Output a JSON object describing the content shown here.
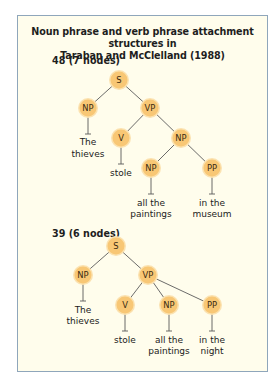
{
  "figure": {
    "title_line1": "Noun phrase and verb phrase attachment structures in",
    "title_line2": "Taraban and McClelland (1988)",
    "colors": {
      "background": "#fffdec",
      "border": "#8fa6bb",
      "node_fill": "#f8c775",
      "edge": "#5a5a5a"
    }
  },
  "trees": [
    {
      "label": "48 (7 nodes)",
      "nodes": [
        {
          "id": "s",
          "label": "S",
          "x": 119,
          "y": 80
        },
        {
          "id": "np1",
          "label": "NP",
          "x": 88,
          "y": 108
        },
        {
          "id": "vp",
          "label": "VP",
          "x": 150,
          "y": 108
        },
        {
          "id": "v",
          "label": "V",
          "x": 121,
          "y": 138
        },
        {
          "id": "np2",
          "label": "NP",
          "x": 181,
          "y": 138
        },
        {
          "id": "np3",
          "label": "NP",
          "x": 151,
          "y": 168
        },
        {
          "id": "pp",
          "label": "PP",
          "x": 212,
          "y": 168
        }
      ],
      "leaves": [
        {
          "lines": [
            "The",
            "thieves"
          ]
        },
        {
          "lines": [
            "stole"
          ]
        },
        {
          "lines": [
            "all the",
            "paintings"
          ]
        },
        {
          "lines": [
            "in the",
            "museum"
          ]
        }
      ]
    },
    {
      "label": "39 (6 nodes)",
      "nodes": [
        {
          "id": "s",
          "label": "S",
          "x": 116,
          "y": 246
        },
        {
          "id": "np1",
          "label": "NP",
          "x": 83,
          "y": 275
        },
        {
          "id": "vp",
          "label": "VP",
          "x": 148,
          "y": 275
        },
        {
          "id": "v",
          "label": "V",
          "x": 125,
          "y": 305
        },
        {
          "id": "np2",
          "label": "NP",
          "x": 169,
          "y": 305
        },
        {
          "id": "pp",
          "label": "PP",
          "x": 212,
          "y": 305
        }
      ],
      "leaves": [
        {
          "lines": [
            "The",
            "thieves"
          ]
        },
        {
          "lines": [
            "stole"
          ]
        },
        {
          "lines": [
            "all the",
            "paintings"
          ]
        },
        {
          "lines": [
            "in the",
            "night"
          ]
        }
      ]
    }
  ]
}
